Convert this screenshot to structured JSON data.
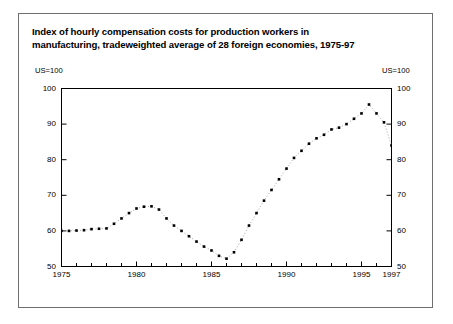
{
  "figure": {
    "title_line1": "Index of hourly compensation costs for production workers in",
    "title_line2": "manufacturing, tradeweighted average of 28 foreign economies, 1975-97",
    "unit_left": "US=100",
    "unit_right": "US=100"
  },
  "chart_data": {
    "type": "line",
    "title": "Index of hourly compensation costs for production workers in manufacturing, tradeweighted average of 28 foreign economies, 1975-97",
    "xlabel": "",
    "ylabel": "US=100",
    "ylim": [
      50,
      100
    ],
    "xlim": [
      1975,
      1997
    ],
    "grid": false,
    "legend": null,
    "marker": "square",
    "linestyle": "dotted",
    "color": "#000000",
    "ytick_labels": [
      "50",
      "60",
      "70",
      "80",
      "90",
      "100"
    ],
    "ytick_values": [
      50,
      60,
      70,
      80,
      90,
      100
    ],
    "xtick_labels": [
      "1975",
      "1980",
      "1985",
      "1990",
      "1995",
      "1997"
    ],
    "xtick_values": [
      1975,
      1980,
      1985,
      1990,
      1995,
      1997
    ],
    "xminor_values": [
      1976,
      1977,
      1978,
      1979,
      1981,
      1982,
      1983,
      1984,
      1986,
      1987,
      1988,
      1989,
      1991,
      1992,
      1993,
      1994,
      1996
    ],
    "x": [
      1975.0,
      1975.5,
      1976.0,
      1976.5,
      1977.0,
      1977.5,
      1978.0,
      1978.5,
      1979.0,
      1979.5,
      1980.0,
      1980.5,
      1981.0,
      1981.5,
      1982.0,
      1982.5,
      1983.0,
      1983.5,
      1984.0,
      1984.5,
      1985.0,
      1985.5,
      1986.0,
      1986.5,
      1987.0,
      1987.5,
      1988.0,
      1988.5,
      1989.0,
      1989.5,
      1990.0,
      1990.5,
      1991.0,
      1991.5,
      1992.0,
      1992.5,
      1993.0,
      1993.5,
      1994.0,
      1994.5,
      1995.0,
      1995.5,
      1996.0,
      1996.5,
      1997.0
    ],
    "values": [
      60.0,
      60.0,
      60.1,
      60.2,
      60.5,
      60.6,
      60.7,
      62.0,
      63.5,
      65.0,
      66.3,
      66.8,
      66.9,
      66.0,
      63.5,
      61.5,
      60.0,
      58.5,
      57.0,
      55.6,
      54.5,
      53.0,
      52.2,
      54.0,
      57.5,
      61.5,
      65.0,
      68.5,
      71.5,
      74.5,
      77.5,
      80.5,
      82.5,
      84.5,
      86.0,
      87.0,
      88.5,
      89.0,
      90.0,
      91.5,
      93.0,
      95.5,
      93.0,
      90.5,
      84.0
    ],
    "series": [
      {
        "name": "Index of hourly compensation costs (US=100)",
        "values": [
          60.0,
          60.0,
          60.1,
          60.2,
          60.5,
          60.6,
          60.7,
          62.0,
          63.5,
          65.0,
          66.3,
          66.8,
          66.9,
          66.0,
          63.5,
          61.5,
          60.0,
          58.5,
          57.0,
          55.6,
          54.5,
          53.0,
          52.2,
          54.0,
          57.5,
          61.5,
          65.0,
          68.5,
          71.5,
          74.5,
          77.5,
          80.5,
          82.5,
          84.5,
          86.0,
          87.0,
          88.5,
          89.0,
          90.0,
          91.5,
          93.0,
          95.5,
          93.0,
          90.5,
          84.0
        ]
      }
    ],
    "annotations": []
  }
}
